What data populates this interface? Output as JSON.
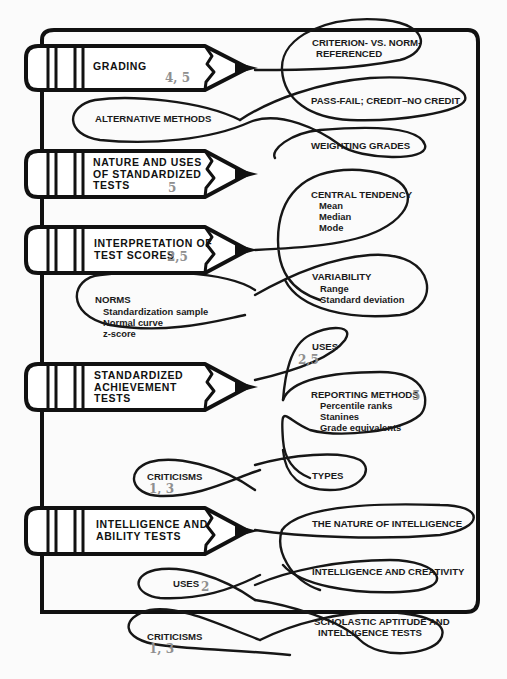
{
  "diagram": {
    "type": "concept-map",
    "style": "pencils with looped rope connectors",
    "colors": {
      "ink": "#111111",
      "reference_numbers": "#8f8f8f",
      "background": "#fbfbfb"
    },
    "pencils": [
      {
        "id": "grading",
        "title_lines": [
          "GRADING"
        ],
        "refs": "4, 5",
        "topics": [
          {
            "label_lines": [
              "CRITERION- VS. NORM-",
              "REFERENCED"
            ]
          },
          {
            "label_lines": [
              "PASS-FAIL; CREDIT–NO CREDIT"
            ]
          },
          {
            "label_lines": [
              "ALTERNATIVE METHODS"
            ]
          },
          {
            "label_lines": [
              "WEIGHTING GRADES"
            ]
          }
        ]
      },
      {
        "id": "nature-uses",
        "title_lines": [
          "NATURE AND USES",
          "OF STANDARDIZED",
          "TESTS"
        ],
        "refs": "5",
        "topics": []
      },
      {
        "id": "interpretation",
        "title_lines": [
          "INTERPRETATION OF",
          "TEST SCORES"
        ],
        "refs": "2,5",
        "topics": [
          {
            "label_lines": [
              "CENTRAL TENDENCY"
            ],
            "items": [
              "Mean",
              "Median",
              "Mode"
            ]
          },
          {
            "label_lines": [
              "VARIABILITY"
            ],
            "items": [
              "Range",
              "Standard deviation"
            ]
          },
          {
            "label_lines": [
              "NORMS"
            ],
            "items": [
              "Standardization sample",
              "Normal curve",
              "z-score"
            ]
          }
        ]
      },
      {
        "id": "achievement",
        "title_lines": [
          "STANDARDIZED",
          "ACHIEVEMENT",
          "TESTS"
        ],
        "refs": "",
        "topics": [
          {
            "label_lines": [
              "USES"
            ],
            "refs": "2,5"
          },
          {
            "label_lines": [
              "REPORTING METHODS"
            ],
            "refs": "5",
            "items": [
              "Percentile ranks",
              "Stanines",
              "Grade equivalents"
            ]
          },
          {
            "label_lines": [
              "CRITICISMS"
            ],
            "refs": "1, 3"
          },
          {
            "label_lines": [
              "TYPES"
            ]
          }
        ]
      },
      {
        "id": "intelligence",
        "title_lines": [
          "INTELLIGENCE AND",
          "ABILITY TESTS"
        ],
        "refs": "",
        "topics": [
          {
            "label_lines": [
              "THE NATURE OF INTELLIGENCE"
            ]
          },
          {
            "label_lines": [
              "INTELLIGENCE AND CREATIVITY"
            ]
          },
          {
            "label_lines": [
              "USES"
            ],
            "refs": "2"
          },
          {
            "label_lines": [
              "SCHOLASTIC APTITUDE AND",
              "INTELLIGENCE TESTS"
            ]
          },
          {
            "label_lines": [
              "CRITICISMS"
            ],
            "refs": "1, 3"
          }
        ]
      }
    ]
  }
}
